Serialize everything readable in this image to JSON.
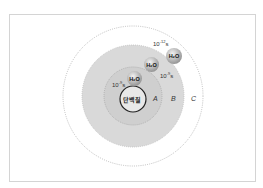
{
  "diagram": {
    "center_label": "단백질",
    "regions": [
      {
        "id": "A",
        "label": "A"
      },
      {
        "id": "B",
        "label": "B"
      },
      {
        "id": "C",
        "label": "C"
      }
    ],
    "molecules": [
      {
        "label": "H₂O",
        "time": "10⁻⁹s"
      },
      {
        "label": "H₂O",
        "time": "10⁻⁸s"
      },
      {
        "label": "H₂O",
        "time": "10⁻¹²s"
      }
    ],
    "times": {
      "t1": "10",
      "t1e": "-9",
      "t2": "10",
      "t2e": "-9",
      "t3": "10",
      "t3e": "-12",
      "unit": "s"
    },
    "colors": {
      "region_b": "#d6d6d6",
      "region_a": "#c8c8c8",
      "border": "#d4d4d4"
    }
  }
}
